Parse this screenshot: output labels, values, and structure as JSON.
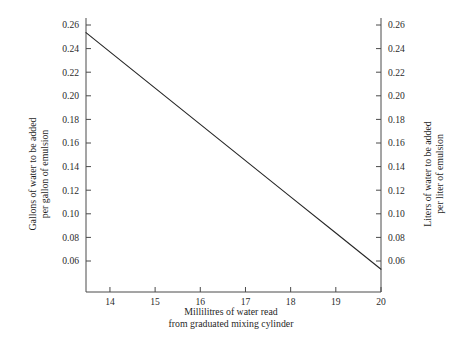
{
  "chart_data": {
    "type": "line",
    "title": "",
    "xlabel": "Millilitres of water read\nfrom graduated mixing cylinder",
    "ylabel": "Gallons of water to be added\nper gallon of emulsion",
    "y2label": "Liters of water to be added\nper liter of emulsion",
    "xlim": [
      13.47,
      20.3
    ],
    "ylim": [
      0.0495,
      0.2665
    ],
    "y2lim": [
      0.0495,
      0.2665
    ],
    "grid": false,
    "legend": null,
    "x": [
      13.47,
      20.0
    ],
    "y": [
      0.2535,
      0.053
    ],
    "series": [
      {
        "name": "Water addition curve",
        "x": [
          13.47,
          14,
          15,
          16,
          17,
          18,
          19,
          20
        ],
        "values": [
          0.2535,
          0.2372,
          0.2065,
          0.1758,
          0.1451,
          0.1144,
          0.0837,
          0.053
        ]
      }
    ],
    "xticks": [
      14,
      15,
      16,
      17,
      18,
      19,
      20
    ],
    "xtick_labels": [
      "14",
      "15",
      "16",
      "17",
      "18",
      "19",
      "20"
    ],
    "yticks": [
      0.06,
      0.08,
      0.1,
      0.12,
      0.14,
      0.16,
      0.18,
      0.2,
      0.22,
      0.24,
      0.26
    ],
    "ytick_labels": [
      "0.06",
      "0.08",
      "0.10",
      "0.12",
      "0.14",
      "0.16",
      "0.18",
      "0.20",
      "0.22",
      "0.24",
      "0.26"
    ],
    "y2ticks": [
      0.06,
      0.08,
      0.1,
      0.12,
      0.14,
      0.16,
      0.18,
      0.2,
      0.22,
      0.24,
      0.26
    ],
    "y2tick_labels": [
      "0.06",
      "0.08",
      "0.10",
      "0.12",
      "0.14",
      "0.16",
      "0.18",
      "0.20",
      "0.22",
      "0.24",
      "0.26"
    ],
    "line_color": "#262626",
    "axis_color": "#4a4a4a",
    "background": "#ffffff"
  },
  "axes": {
    "left_title_line1": "Gallons of water to be added",
    "left_title_line2": "per gallon of emulsion",
    "right_title_line1": "Liters of water to be added",
    "right_title_line2": "per liter of emulsion"
  },
  "caption": {
    "line1": "Millilitres of water read",
    "line2": "from graduated mixing cylinder"
  }
}
